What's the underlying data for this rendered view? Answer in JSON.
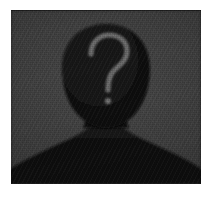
{
  "image": {
    "kind": "anonymous-user-avatar-placeholder",
    "alt_text": "Anonymous user silhouette with question mark",
    "width": "215",
    "height": "206"
  },
  "frame": {
    "paper_color": "#ffffff",
    "margin_left": "11",
    "margin_top": "10",
    "photo_width": "190",
    "photo_height": "174"
  },
  "photo": {
    "backdrop_color": "#3a3a3a",
    "backdrop_highlight_color": "#4a4a4a",
    "backdrop_shadow_color": "#222222",
    "silhouette_color": "#111111",
    "silhouette_edge_color": "#0a0a0a",
    "grain": "film-grain-halftone"
  },
  "silhouette": {
    "label": "unknown-person-silhouette",
    "head_label": "head-shape",
    "neck_label": "neck-shape",
    "shoulders_label": "shoulders-shape"
  },
  "question_mark": {
    "glyph": "?",
    "stroke_color": "#6a6a6a",
    "dot_color": "#6f6f6f",
    "center_x": "108",
    "center_y": "68"
  }
}
